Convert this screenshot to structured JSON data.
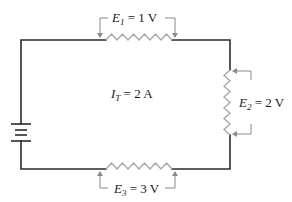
{
  "diagram": {
    "type": "series-circuit",
    "colors": {
      "wire": "#2b2b2b",
      "resistor": "#a8a8a8",
      "arrow": "#8a8a8a",
      "text": "#1a1a1a"
    },
    "source": {
      "kind": "battery",
      "position": "left"
    },
    "current": {
      "symbol": "I",
      "subscript": "T",
      "eq": " = 2 A"
    },
    "resistors": [
      {
        "id": "R1",
        "position": "top",
        "symbol": "E",
        "subscript": "1",
        "eq": " = 1 V"
      },
      {
        "id": "R2",
        "position": "right",
        "symbol": "E",
        "subscript": "2",
        "eq": " = 2 V"
      },
      {
        "id": "R3",
        "position": "bottom",
        "symbol": "E",
        "subscript": "3",
        "eq": " = 3 V"
      }
    ]
  }
}
